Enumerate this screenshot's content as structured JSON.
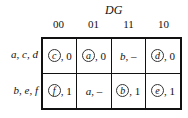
{
  "column_variable": "DG",
  "columns": [
    "00",
    "01",
    "11",
    "10"
  ],
  "rows": [
    {
      "label": "a, c, d",
      "cells": [
        {
          "state": "c",
          "circled": true,
          "output": "0"
        },
        {
          "state": "a",
          "circled": true,
          "output": "0"
        },
        {
          "state": "b",
          "circled": false,
          "output": "–"
        },
        {
          "state": "d",
          "circled": true,
          "output": "0"
        }
      ]
    },
    {
      "label": "b, e, f",
      "cells": [
        {
          "state": "f",
          "circled": true,
          "output": "1"
        },
        {
          "state": "a",
          "circled": false,
          "output": "–"
        },
        {
          "state": "b",
          "circled": true,
          "output": "1"
        },
        {
          "state": "e",
          "circled": true,
          "output": "1"
        }
      ]
    }
  ]
}
